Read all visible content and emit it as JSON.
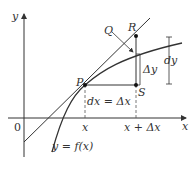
{
  "diagram": {
    "type": "differential-approximation",
    "axes": {
      "x_label": "x",
      "y_label": "y",
      "origin_label": "0"
    },
    "points": [
      {
        "name": "P",
        "label": "P"
      },
      {
        "name": "Q",
        "label": "Q"
      },
      {
        "name": "R",
        "label": "R"
      },
      {
        "name": "S",
        "label": "S"
      }
    ],
    "labels": {
      "dx_eq": "dx = Δx",
      "delta_y": "Δy",
      "dy": "dy",
      "x_tick": "x",
      "x_plus_dx_tick": "x + Δx",
      "curve": "y = f(x)"
    },
    "colors": {
      "stroke": "#333333",
      "dashed": "#555555"
    }
  }
}
